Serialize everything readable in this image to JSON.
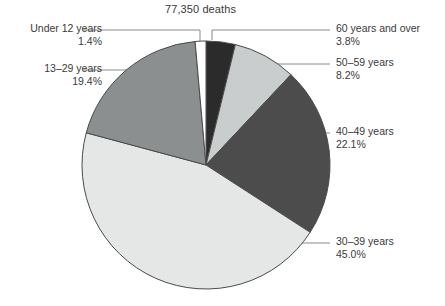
{
  "chart_data": {
    "type": "pie",
    "title": "77,350 deaths",
    "subtitle": "",
    "xlabel": "",
    "ylabel": "",
    "total_label": "77,350 deaths",
    "total_value": 77350,
    "unit": "deaths",
    "legend_position": "callouts",
    "grid": false,
    "start_angle_deg": 0,
    "direction": "clockwise",
    "categories": [
      "60 years and over",
      "50–59 years",
      "40–49 years",
      "30–39 years",
      "13–29 years",
      "Under 12 years"
    ],
    "values": [
      3.8,
      8.2,
      22.1,
      45.0,
      19.4,
      1.4
    ],
    "value_labels": [
      "3.8%",
      "8.2%",
      "22.1%",
      "45.0%",
      "19.4%",
      "1.4%"
    ],
    "colors": [
      "#2b2b2b",
      "#c9cdcd",
      "#4c4c4c",
      "#e5e7e7",
      "#8b8f8f",
      "#ffffff"
    ],
    "slices": [
      {
        "label": "60 years and over",
        "value": 3.8,
        "value_label": "3.8%",
        "color": "#2b2b2b",
        "side": "right"
      },
      {
        "label": "50–59 years",
        "value": 8.2,
        "value_label": "8.2%",
        "color": "#c9cdcd",
        "side": "right"
      },
      {
        "label": "40–49 years",
        "value": 22.1,
        "value_label": "22.1%",
        "color": "#4c4c4c",
        "side": "right"
      },
      {
        "label": "30–39 years",
        "value": 45.0,
        "value_label": "45.0%",
        "color": "#e5e7e7",
        "side": "right"
      },
      {
        "label": "13–29 years",
        "value": 19.4,
        "value_label": "19.4%",
        "color": "#8b8f8f",
        "side": "left"
      },
      {
        "label": "Under 12 years",
        "value": 1.4,
        "value_label": "1.4%",
        "color": "#ffffff",
        "side": "left"
      }
    ]
  },
  "callouts": {
    "under12": {
      "label": "Under 12 years",
      "value": "1.4%"
    },
    "age13_29": {
      "label": "13–29 years",
      "value": "19.4%"
    },
    "age60plus": {
      "label": "60 years and over",
      "value": "3.8%"
    },
    "age50_59": {
      "label": "50–59 years",
      "value": "8.2%"
    },
    "age40_49": {
      "label": "40–49 years",
      "value": "22.1%"
    },
    "age30_39": {
      "label": "30–39 years",
      "value": "45.0%"
    }
  },
  "style": {
    "stroke": "#4a4a4a",
    "leader_line": "#8a8a8a",
    "text": "#3a3a3a",
    "background": "#ffffff"
  }
}
